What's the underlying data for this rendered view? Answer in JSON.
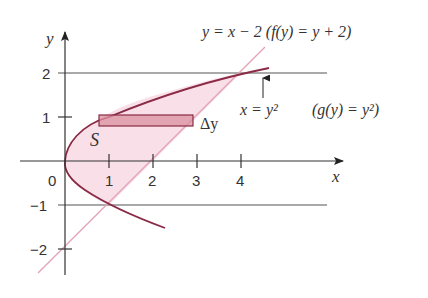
{
  "figure": {
    "axes": {
      "x_label": "x",
      "y_label": "y",
      "x_ticks": [
        "1",
        "2",
        "3",
        "4"
      ],
      "y_ticks_pos": [
        "1",
        "2"
      ],
      "y_ticks_neg": [
        "−1",
        "−2"
      ],
      "origin_label": "0"
    },
    "curves": [
      {
        "name": "line",
        "equation": "y = x − 2",
        "alt": "f(y) = y + 2"
      },
      {
        "name": "parabola",
        "equation": "x = y²",
        "alt": "g(y) = y²"
      }
    ],
    "labels": {
      "line_eq": "y = x − 2 (f(y) = y + 2)",
      "parabola_eq": "x = y²",
      "parabola_alt": "(g(y) = y²)",
      "region": "S",
      "strip": "Δy"
    },
    "horizontal_lines": [
      2,
      -1
    ],
    "colors": {
      "axis": "#333333",
      "curve": "#8a2a45",
      "line": "#e3a6b8",
      "fill": "#f8dde5",
      "strip_fill": "#d9909f",
      "strip_stroke": "#8a2a45"
    }
  }
}
